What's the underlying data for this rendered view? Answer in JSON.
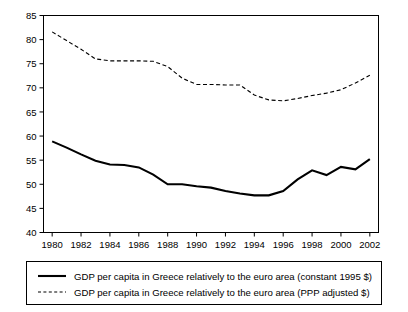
{
  "chart_data": {
    "type": "line",
    "title": "",
    "subtitle": "",
    "xlabel": "",
    "ylabel": "",
    "xlim": [
      1979.4,
      2002.6
    ],
    "ylim": [
      40,
      85
    ],
    "grid": false,
    "legend_position": "bottom",
    "x": [
      1980,
      1981,
      1982,
      1983,
      1984,
      1985,
      1986,
      1987,
      1988,
      1989,
      1990,
      1991,
      1992,
      1993,
      1994,
      1995,
      1996,
      1997,
      1998,
      1999,
      2000,
      2001,
      2002
    ],
    "xticks": [
      "1980",
      "1982",
      "1984",
      "1986",
      "1988",
      "1990",
      "1992",
      "1994",
      "1996",
      "1998",
      "2000",
      "2002"
    ],
    "yticks": [
      "40",
      "45",
      "50",
      "55",
      "60",
      "65",
      "70",
      "75",
      "80",
      "85"
    ],
    "series": [
      {
        "name": "GDP per capita in Greece relatively to the euro area (constant 1995 $)",
        "style": "solid",
        "color": "#000000",
        "values": [
          58.9,
          57.6,
          56.2,
          54.9,
          54.1,
          54.0,
          53.5,
          52.0,
          50.0,
          50.0,
          49.6,
          49.3,
          48.6,
          48.1,
          47.7,
          47.7,
          48.6,
          51.0,
          52.9,
          51.9,
          53.6,
          53.1,
          55.2
        ]
      },
      {
        "name": "GDP per capita in Greece relatively to the euro area (PPP adjusted $)",
        "style": "dashed",
        "color": "#000000",
        "values": [
          81.6,
          79.8,
          78.0,
          76.0,
          75.6,
          75.6,
          75.6,
          75.5,
          74.4,
          72.0,
          70.7,
          70.7,
          70.6,
          70.6,
          68.5,
          67.5,
          67.3,
          67.8,
          68.4,
          68.9,
          69.6,
          71.0,
          72.6
        ]
      }
    ]
  },
  "legend": {
    "entries": [
      {
        "marker": "solid-line-swatch",
        "label": "GDP per capita in Greece relatively to the euro area (constant 1995 $)"
      },
      {
        "marker": "dashed-line-swatch",
        "label": "GDP per capita in Greece relatively to the euro area (PPP adjusted $)"
      }
    ]
  },
  "colors": {
    "axis": "#000000",
    "plot_border": "#000000",
    "background": "#ffffff",
    "series_primary": "#000000",
    "series_secondary": "#000000"
  }
}
